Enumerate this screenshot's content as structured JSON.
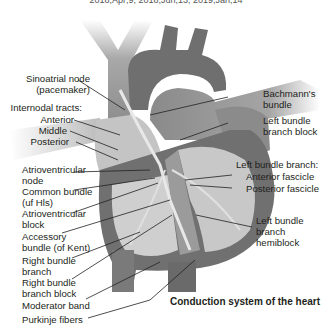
{
  "header": {
    "partial_caption": "2018;Apr;9; 2018;Jun;13; 2019;Jan;14"
  },
  "diagram": {
    "title": "Conduction system of the heart",
    "left_labels": [
      {
        "id": "sa-node",
        "lines": [
          "Sinoatrial node",
          "(pacemaker)"
        ]
      },
      {
        "id": "internodal",
        "lines": [
          "Internodal tracts:"
        ]
      },
      {
        "id": "anterior",
        "lines": [
          "Anterior"
        ]
      },
      {
        "id": "middle",
        "lines": [
          "Middle"
        ]
      },
      {
        "id": "posterior",
        "lines": [
          "Posterior"
        ]
      },
      {
        "id": "av-node",
        "lines": [
          "Atrioventricular",
          "node"
        ]
      },
      {
        "id": "common-bundle",
        "lines": [
          "Common bundle",
          "(uf Hls)"
        ]
      },
      {
        "id": "av-block",
        "lines": [
          "Atrioventricular",
          "block"
        ]
      },
      {
        "id": "accessory",
        "lines": [
          "Accessory",
          "bundle (of Kent)"
        ]
      },
      {
        "id": "rbb",
        "lines": [
          "Right bundle",
          "branch"
        ]
      },
      {
        "id": "rbbb",
        "lines": [
          "Right bundle",
          "branch block"
        ]
      },
      {
        "id": "moderator",
        "lines": [
          "Moderator band"
        ]
      },
      {
        "id": "purkinje",
        "lines": [
          "Purkinje fibers"
        ]
      }
    ],
    "right_labels": [
      {
        "id": "bachmann",
        "lines": [
          "Bachmann's",
          "bundle"
        ]
      },
      {
        "id": "lbbb",
        "lines": [
          "Left bundle",
          "branch block"
        ]
      },
      {
        "id": "lbb",
        "lines": [
          "Left bundle branch:"
        ]
      },
      {
        "id": "ant-fascicle",
        "lines": [
          "Anterior fascicle"
        ]
      },
      {
        "id": "post-fascicle",
        "lines": [
          "Posterior fascicle"
        ]
      },
      {
        "id": "lbb-hemiblock",
        "lines": [
          "Left bundle",
          "branch",
          "hemiblock"
        ]
      }
    ]
  },
  "colors": {
    "dark_tissue": "#6d6d6d",
    "mid_tissue": "#8e8e8e",
    "light_tissue": "#c9c9c9",
    "vessel": "#9a9a9a",
    "leader_line": "#231f20",
    "text": "#231f20"
  }
}
